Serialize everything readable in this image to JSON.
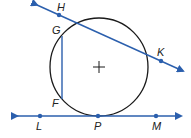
{
  "diagram": {
    "type": "circle-geometry",
    "colors": {
      "line": "#2b5fad",
      "circle": "#1a1a1a",
      "point": "#2b5fad"
    },
    "circle": {
      "center_marker": "+"
    },
    "points": {
      "H": "H",
      "G": "G",
      "K": "K",
      "F": "F",
      "L": "L",
      "P": "P",
      "M": "M"
    },
    "lines": [
      {
        "name": "secant HK",
        "through": [
          "H",
          "K"
        ],
        "arrows": "both"
      },
      {
        "name": "tangent LM",
        "through": [
          "L",
          "P",
          "M"
        ],
        "arrows": "both"
      }
    ],
    "segments": [
      {
        "name": "chord GF",
        "endpoints": [
          "G",
          "F"
        ]
      }
    ]
  }
}
